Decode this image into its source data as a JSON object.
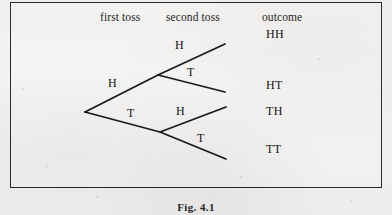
{
  "figure": {
    "caption": "Fig. 4.1",
    "headers": {
      "first_toss": "first toss",
      "second_toss": "second toss",
      "outcome": "outcome"
    },
    "branch_labels": {
      "first_h": "H",
      "first_t": "T",
      "second_h_top": "H",
      "second_t_top": "T",
      "second_h_bottom": "H",
      "second_t_bottom": "T"
    },
    "outcomes": [
      "HH",
      "HT",
      "TH",
      "TT"
    ],
    "colors": {
      "ink": "#1a1a1a",
      "paper": "#f3f2f0",
      "frame": "#2b2b2b"
    }
  }
}
